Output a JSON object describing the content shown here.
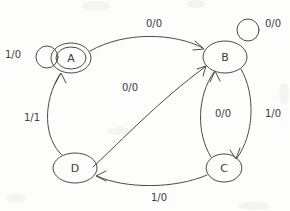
{
  "diagram": {
    "kind": "finite-state-machine",
    "notation": "input/output",
    "title": "",
    "canvas": {
      "width": 290,
      "height": 211
    },
    "stroke_color": "#4a4a4a",
    "text_color": "#3c3c3c",
    "background_color": "#fdfdfc",
    "states": [
      {
        "id": "A",
        "label": "A",
        "accepting": true,
        "double_circle": true,
        "cx": 71,
        "cy": 58,
        "rx": 20,
        "ry": 15,
        "inner_rx": 15,
        "inner_ry": 11
      },
      {
        "id": "B",
        "label": "B",
        "accepting": false,
        "double_circle": false,
        "cx": 225,
        "cy": 57,
        "rx": 22,
        "ry": 16,
        "inner_rx": 0,
        "inner_ry": 0
      },
      {
        "id": "C",
        "label": "C",
        "accepting": false,
        "double_circle": false,
        "cx": 224,
        "cy": 168,
        "rx": 18,
        "ry": 14,
        "inner_rx": 0,
        "inner_ry": 0
      },
      {
        "id": "D",
        "label": "D",
        "accepting": false,
        "double_circle": false,
        "cx": 75,
        "cy": 168,
        "rx": 22,
        "ry": 15,
        "inner_rx": 0,
        "inner_ry": 0
      }
    ],
    "transitions": [
      {
        "id": "a-self",
        "from": "A",
        "to": "A",
        "label": "1/0",
        "input": "1",
        "output": "0",
        "self_loop": true,
        "label_x": 13,
        "label_y": 55
      },
      {
        "id": "a-to-b",
        "from": "A",
        "to": "B",
        "label": "0/0",
        "input": "0",
        "output": "0",
        "self_loop": false,
        "label_x": 154,
        "label_y": 24
      },
      {
        "id": "b-self",
        "from": "B",
        "to": "B",
        "label": "0/0",
        "input": "0",
        "output": "0",
        "self_loop": true,
        "label_x": 273,
        "label_y": 24
      },
      {
        "id": "b-to-c",
        "from": "B",
        "to": "C",
        "label": "1/0",
        "input": "1",
        "output": "0",
        "self_loop": false,
        "label_x": 273,
        "label_y": 114
      },
      {
        "id": "c-to-b",
        "from": "C",
        "to": "B",
        "label": "0/0",
        "input": "0",
        "output": "0",
        "self_loop": false,
        "label_x": 223,
        "label_y": 114
      },
      {
        "id": "c-to-d",
        "from": "C",
        "to": "D",
        "label": "1/0",
        "input": "1",
        "output": "0",
        "self_loop": false,
        "label_x": 159,
        "label_y": 198
      },
      {
        "id": "d-to-a",
        "from": "D",
        "to": "A",
        "label": "1/1",
        "input": "1",
        "output": "1",
        "self_loop": false,
        "label_x": 32,
        "label_y": 118
      },
      {
        "id": "d-to-b",
        "from": "D",
        "to": "B",
        "label": "0/0",
        "input": "0",
        "output": "0",
        "self_loop": false,
        "label_x": 130,
        "label_y": 88
      }
    ]
  }
}
